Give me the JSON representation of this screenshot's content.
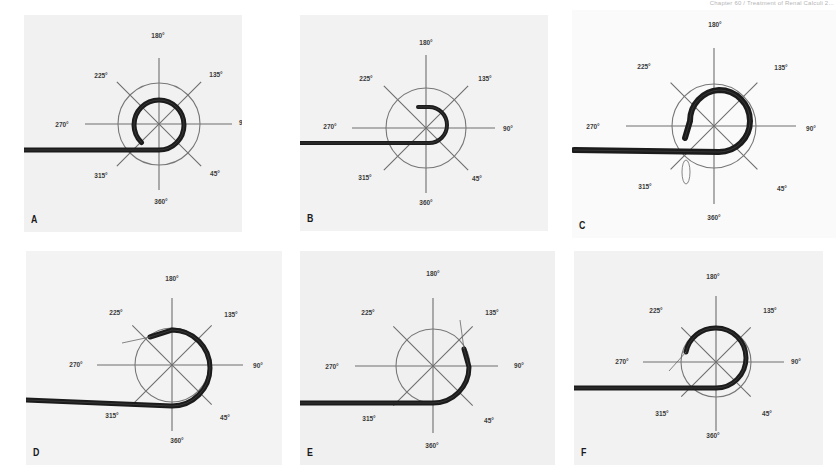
{
  "page": {
    "running_head": "Chapter 60 / Treatment of Renal Calculi 2..."
  },
  "figure": {
    "angle_labels": [
      "180°",
      "225°",
      "135°",
      "270°",
      "90°",
      "315°",
      "45°",
      "360°"
    ]
  },
  "chart_data": {
    "type": "diagram",
    "title": "",
    "panels": [
      {
        "id": "A",
        "label": "A",
        "box": [
          24,
          15,
          218,
          217
        ],
        "bg": "#f1f1f1",
        "center": [
          159,
          124
        ],
        "circle_r": 41,
        "spoke_len": 68,
        "hline": [
          85,
          232
        ],
        "vline": [
          58,
          190
        ],
        "labels": {
          "180": [
            158,
            38
          ],
          "225": [
            101,
            78
          ],
          "135": [
            216,
            77
          ],
          "270": [
            62,
            127
          ],
          "90": [
            244,
            125
          ],
          "315": [
            101,
            178
          ],
          "45": [
            215,
            176
          ],
          "360": [
            161,
            204
          ]
        },
        "wire": {
          "y": 150,
          "x_start": 24,
          "width": 5,
          "loop_r": 25,
          "end_angle_deg": 225,
          "turns": "near-full loop, tip near 315°"
        }
      },
      {
        "id": "B",
        "label": "B",
        "box": [
          300,
          15,
          248,
          216
        ],
        "bg": "#f2f2f2",
        "center": [
          426,
          128
        ],
        "circle_r": 40,
        "spoke_len": 68,
        "hline": [
          352,
          495
        ],
        "vline": [
          55,
          193
        ],
        "labels": {
          "180": [
            426,
            45
          ],
          "225": [
            366,
            81
          ],
          "135": [
            485,
            81
          ],
          "270": [
            330,
            129
          ],
          "90": [
            508,
            131
          ],
          "315": [
            365,
            180
          ],
          "45": [
            477,
            181
          ],
          "360": [
            426,
            205
          ]
        },
        "wire": {
          "y": 143,
          "x_start": 300,
          "width": 4,
          "loop_r": 18,
          "tip": [
            418,
            107
          ],
          "turns": "hook, tip near 180°"
        }
      },
      {
        "id": "C",
        "label": "C",
        "box": [
          572,
          10,
          264,
          228
        ],
        "bg": "#fafafa",
        "center": [
          714,
          126
        ],
        "circle_r": 42,
        "spoke_len": 70,
        "hline": [
          626,
          796
        ],
        "vline": [
          48,
          204
        ],
        "labels": {
          "180": [
            715,
            27
          ],
          "225": [
            644,
            69
          ],
          "135": [
            781,
            70
          ],
          "270": [
            593,
            129
          ],
          "90": [
            811,
            131
          ],
          "315": [
            645,
            189
          ],
          "45": [
            782,
            191
          ],
          "360": [
            714,
            220
          ]
        },
        "wire": {
          "y": 152,
          "x_start": 574,
          "width": 6,
          "loop_r": 31,
          "tip": [
            685,
            138
          ],
          "balloon": [
            686,
            160,
            4,
            12
          ],
          "turns": "full loop, tip near 315°"
        }
      },
      {
        "id": "D",
        "label": "D",
        "box": [
          26,
          251,
          256,
          214
        ],
        "bg": "#f3f3f3",
        "center": [
          172,
          365
        ],
        "circle_r": 37,
        "spoke_len": 64,
        "hline": [
          97,
          243
        ],
        "vline": [
          298,
          431
        ],
        "labels": {
          "180": [
            172,
            281
          ],
          "225": [
            116,
            315
          ],
          "135": [
            231,
            317
          ],
          "270": [
            76,
            367
          ],
          "90": [
            258,
            368
          ],
          "315": [
            112,
            418
          ],
          "45": [
            225,
            420
          ],
          "360": [
            177,
            443
          ]
        },
        "wire": {
          "y": 406,
          "x_start": 26,
          "width": 5,
          "loop_r": 38,
          "tip": [
            150,
            337
          ],
          "guidewire_tip": [
            122,
            343
          ],
          "turns": "near-full loop, tip near 225°"
        }
      },
      {
        "id": "E",
        "label": "E",
        "box": [
          300,
          251,
          255,
          214
        ],
        "bg": "#f0f0f0",
        "center": [
          433,
          366
        ],
        "circle_r": 37,
        "spoke_len": 64,
        "hline": [
          355,
          498
        ],
        "vline": [
          298,
          433
        ],
        "labels": {
          "180": [
            433,
            276
          ],
          "225": [
            368,
            315
          ],
          "135": [
            492,
            315
          ],
          "270": [
            332,
            369
          ],
          "90": [
            519,
            368
          ],
          "315": [
            369,
            421
          ],
          "45": [
            489,
            423
          ],
          "360": [
            432,
            448
          ]
        },
        "wire": {
          "y": 403,
          "x_start": 300,
          "width": 5,
          "loop_r": 36,
          "tip": [
            464,
            349
          ],
          "guidewire_tip": [
            460,
            320
          ],
          "turns": "half loop, tip near 135°"
        }
      },
      {
        "id": "F",
        "label": "F",
        "box": [
          574,
          251,
          249,
          214
        ],
        "bg": "#f2f2f2",
        "center": [
          716,
          362
        ],
        "circle_r": 35,
        "spoke_len": 56,
        "hline": [
          643,
          784
        ],
        "vline": [
          296,
          431
        ],
        "labels": {
          "180": [
            713,
            279
          ],
          "225": [
            656,
            313
          ],
          "135": [
            770,
            313
          ],
          "270": [
            622,
            364
          ],
          "90": [
            796,
            364
          ],
          "315": [
            662,
            416
          ],
          "45": [
            767,
            416
          ],
          "360": [
            713,
            438
          ]
        },
        "wire": {
          "y": 388,
          "x_start": 574,
          "width": 5,
          "loop_r": 30,
          "tip": [
            686,
            352
          ],
          "guidewire_tip": [
            669,
            371
          ],
          "turns": "near-full loop, tip near 270°"
        }
      }
    ]
  }
}
